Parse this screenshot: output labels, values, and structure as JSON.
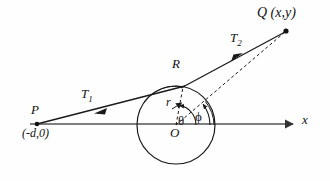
{
  "figure": {
    "background_color": "#fefefe",
    "stroke_color": "#1a1a1a",
    "axis_color": "#555555",
    "labels": {
      "point_q": "Q (x,y)",
      "segment_t2": "T",
      "segment_t2_sub": "2",
      "point_r": "R",
      "segment_t1": "T",
      "segment_t1_sub": "1",
      "point_p": "P",
      "point_p_coords": "(-d,0)",
      "radius": "r",
      "angle_theta": "θ",
      "angle_phi": "ϕ",
      "origin": "O",
      "axis_x": "x"
    }
  },
  "geometry": {
    "circle": {
      "cx": 176,
      "cy": 125,
      "r": 39
    },
    "points": {
      "P": {
        "x": 37,
        "y": 124
      },
      "Q": {
        "x": 286,
        "y": 31
      },
      "R": {
        "x": 183,
        "y": 87
      },
      "O": {
        "x": 176,
        "y": 125
      }
    },
    "axis": {
      "x_start": 30,
      "x_end": 297,
      "y": 124
    },
    "angles": {
      "theta_deg": 78,
      "phi_deg": 37
    }
  }
}
